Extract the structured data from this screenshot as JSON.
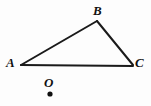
{
  "figure": {
    "kind": "geometry-triangle-with-point",
    "background_color": "#fdfdfd",
    "stroke_color": "#1a1a1a",
    "stroke_width": 2,
    "width": 151,
    "height": 106,
    "triangle": {
      "name": "ABC",
      "vertices": [
        {
          "label": "A",
          "x": 21,
          "y": 65,
          "label_x": 6,
          "label_y": 56
        },
        {
          "label": "B",
          "x": 97,
          "y": 21,
          "label_x": 93,
          "label_y": 4
        },
        {
          "label": "C",
          "x": 133,
          "y": 65,
          "label_x": 135,
          "label_y": 56
        }
      ],
      "edges": [
        {
          "name": "AB",
          "from": "A",
          "to": "B"
        },
        {
          "name": "BC",
          "from": "B",
          "to": "C"
        },
        {
          "name": "AC",
          "from": "A",
          "to": "C"
        }
      ]
    },
    "point": {
      "label": "O",
      "x": 50,
      "y": 94,
      "radius": 2.6,
      "label_x": 44,
      "label_y": 76
    }
  }
}
